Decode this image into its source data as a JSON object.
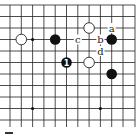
{
  "diagram": {
    "type": "go-board-fragment",
    "grid": {
      "x": [
        10,
        21.3,
        32.6,
        43.9,
        55.2,
        66.5,
        77.8,
        89.1,
        100.4,
        111.7,
        123,
        135
      ],
      "y": [
        5,
        16.5,
        28,
        39.5,
        51,
        62.5,
        74,
        85.5,
        97,
        108.5,
        120,
        131
      ],
      "edges": [
        "top",
        "right"
      ]
    },
    "stones": [
      {
        "color": "white",
        "col": 1,
        "row": 3,
        "label": ""
      },
      {
        "color": "black",
        "col": 4,
        "row": 3,
        "label": ""
      },
      {
        "color": "white",
        "col": 7,
        "row": 2,
        "label": ""
      },
      {
        "color": "black",
        "col": 9,
        "row": 3,
        "label": ""
      },
      {
        "color": "black",
        "col": 5,
        "row": 5,
        "label": "1"
      },
      {
        "color": "white",
        "col": 7,
        "row": 5,
        "label": ""
      },
      {
        "color": "black",
        "col": 9,
        "row": 6,
        "label": ""
      }
    ],
    "letters": [
      {
        "text": "a",
        "col": 9,
        "row": 2
      },
      {
        "text": "b",
        "col": 8,
        "row": 3
      },
      {
        "text": "c",
        "col": 6,
        "row": 3
      },
      {
        "text": "d",
        "col": 8,
        "row": 4
      }
    ],
    "star_points": [
      {
        "col": 2,
        "row": 3
      },
      {
        "col": 2,
        "row": 9
      },
      {
        "col": 8,
        "row": 9
      }
    ],
    "colors": {
      "black": "#111111",
      "white": "#ffffff",
      "line": "#222222"
    }
  }
}
